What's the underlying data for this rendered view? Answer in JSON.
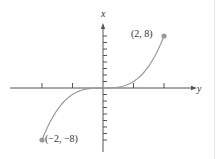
{
  "chart_data": {
    "type": "line",
    "title": "",
    "function": "x = y^3",
    "xlabel": "y",
    "ylabel": "x",
    "horizontal_axis": {
      "label": "y",
      "range": [
        -3,
        3
      ],
      "tick_values": [
        -2,
        -1,
        1,
        2
      ]
    },
    "vertical_axis": {
      "label": "x",
      "range": [
        -9,
        9
      ],
      "tick_values": [
        -8,
        -7,
        -6,
        -5,
        -4,
        -3,
        -2,
        -1,
        1,
        2,
        3,
        4,
        5,
        6,
        7,
        8
      ]
    },
    "series": [
      {
        "name": "x = y^3",
        "points": [
          [
            -2,
            -8
          ],
          [
            -1.75,
            -5.36
          ],
          [
            -1.5,
            -3.375
          ],
          [
            -1.25,
            -1.95
          ],
          [
            -1,
            -1
          ],
          [
            -0.75,
            -0.42
          ],
          [
            -0.5,
            -0.125
          ],
          [
            -0.25,
            -0.016
          ],
          [
            0,
            0
          ],
          [
            0.25,
            0.016
          ],
          [
            0.5,
            0.125
          ],
          [
            0.75,
            0.42
          ],
          [
            1,
            1
          ],
          [
            1.25,
            1.95
          ],
          [
            1.5,
            3.375
          ],
          [
            1.75,
            5.36
          ],
          [
            2,
            8
          ]
        ]
      }
    ],
    "annotations": [
      {
        "text": "(2, 8)",
        "at": [
          2,
          8
        ]
      },
      {
        "text": "(−2, −8)",
        "at": [
          -2,
          -8
        ]
      }
    ],
    "grid": false,
    "legend": null
  },
  "labels": {
    "x_axis_name": "y",
    "y_axis_name": "x",
    "end_point_top": "(2, 8)",
    "end_point_bottom": "(−2, −8)"
  },
  "colors": {
    "axis": "#555555",
    "curve": "#9a9a9a",
    "point": "#9a9a9a",
    "text": "#333333"
  }
}
